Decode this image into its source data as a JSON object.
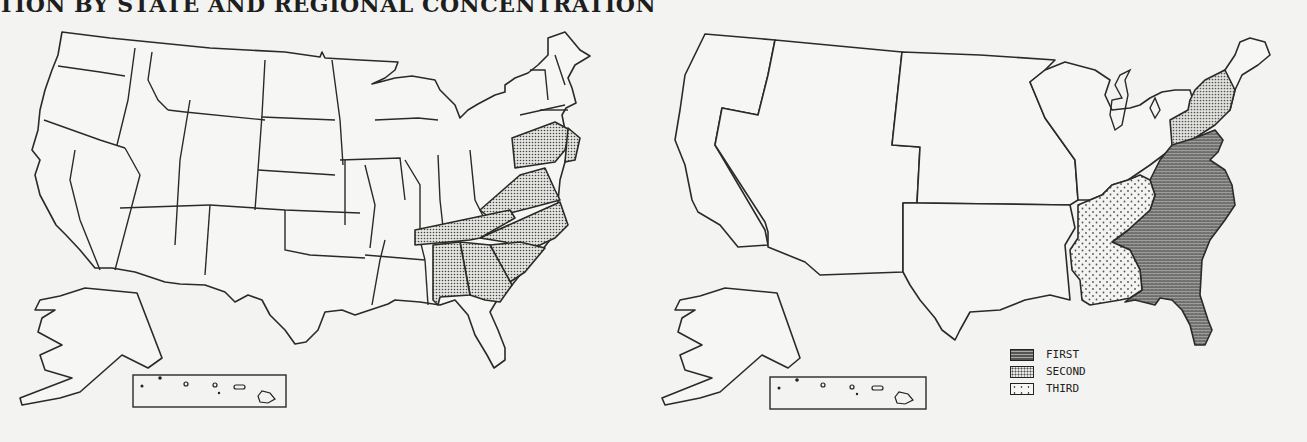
{
  "title": "TION BY STATE AND REGIONAL CONCENTRATION",
  "maps": [
    {
      "name": "state-map",
      "description": "US states; shaded states indicate concentration",
      "shaded_states": [
        "Pennsylvania",
        "New Jersey",
        "Virginia",
        "North Carolina",
        "Tennessee",
        "South Carolina",
        "Georgia",
        "Alabama"
      ],
      "insets": [
        "Alaska",
        "Hawaii"
      ]
    },
    {
      "name": "regional-map",
      "description": "US regions shaded by concentration rank",
      "regions": [
        {
          "rank": "FIRST",
          "area": "South Atlantic (DE, MD, VA, WV, NC, SC, GA, FL)"
        },
        {
          "rank": "SECOND",
          "area": "Middle Atlantic (NY, NJ, PA)"
        },
        {
          "rank": "THIRD",
          "area": "East South Central (KY, TN, AL, MS)"
        }
      ],
      "insets": [
        "Alaska",
        "Hawaii"
      ]
    }
  ],
  "legend": {
    "items": [
      {
        "label": "FIRST",
        "pattern": "dense-crosshatch"
      },
      {
        "label": "SECOND",
        "pattern": "fine-dots"
      },
      {
        "label": "THIRD",
        "pattern": "sparse-dots"
      }
    ]
  },
  "colors": {
    "background": "#f3f3f1",
    "outline": "#2a2a2a",
    "first_fill": "#777777",
    "second_fill": "#cfcfcc",
    "third_fill": "#ececea"
  }
}
